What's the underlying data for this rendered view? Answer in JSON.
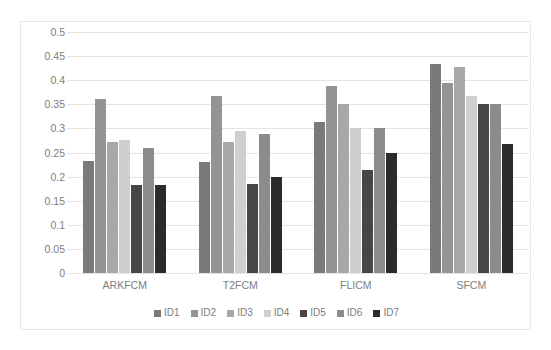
{
  "chart_data": {
    "type": "bar",
    "title": "",
    "subtitle": "",
    "xlabel": "",
    "ylabel": "",
    "categories": [
      "ARKFCM",
      "T2FCM",
      "FLICM",
      "SFCM"
    ],
    "series": [
      {
        "name": "ID1",
        "color": "#7a7a7a",
        "values": [
          0.233,
          0.231,
          0.313,
          0.433
        ]
      },
      {
        "name": "ID2",
        "color": "#949494",
        "values": [
          0.36,
          0.367,
          0.389,
          0.395
        ]
      },
      {
        "name": "ID3",
        "color": "#a8a8a8",
        "values": [
          0.271,
          0.272,
          0.35,
          0.428
        ]
      },
      {
        "name": "ID4",
        "color": "#cfcfcf",
        "values": [
          0.277,
          0.295,
          0.3,
          0.367
        ]
      },
      {
        "name": "ID5",
        "color": "#464646",
        "values": [
          0.183,
          0.184,
          0.214,
          0.35
        ]
      },
      {
        "name": "ID6",
        "color": "#8c8c8c",
        "values": [
          0.26,
          0.288,
          0.3,
          0.35
        ]
      },
      {
        "name": "ID7",
        "color": "#2b2b2b",
        "values": [
          0.182,
          0.199,
          0.248,
          0.268
        ]
      }
    ],
    "ylim": [
      0,
      0.5
    ],
    "ytick_step": 0.05,
    "yticks": [
      "0.5",
      "0.45",
      "0.4",
      "0.35",
      "0.3",
      "0.25",
      "0.2",
      "0.15",
      "0.1",
      "0.05",
      "0"
    ],
    "ytick_values": [
      0.5,
      0.45,
      0.4,
      0.35,
      0.3,
      0.25,
      0.2,
      0.15,
      0.1,
      0.05,
      0
    ],
    "grid": true,
    "grid_axis": "y",
    "legend_position": "bottom",
    "legend_entries": [
      "ID1",
      "ID2",
      "ID3",
      "ID4",
      "ID5",
      "ID6",
      "ID7"
    ],
    "axis_label_color": "#7d7d7d",
    "gridline_color": "#e4e4e4",
    "border_color": "#e8e8e8",
    "background_color": "#ffffff"
  }
}
